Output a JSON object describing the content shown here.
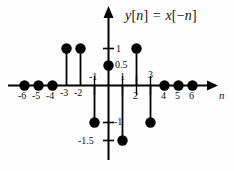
{
  "axis": {
    "x_label": "n",
    "y_label": ""
  },
  "tick_labels": {
    "x": [
      "-6",
      "-5",
      "-4",
      "-3",
      "-2",
      "-1",
      "1",
      "2",
      "3",
      "4",
      "5",
      "6"
    ],
    "y": [
      "1",
      "0.5",
      "-1",
      "-1.5"
    ]
  },
  "chart_data": {
    "type": "scatter",
    "xlabel": "n",
    "ylabel": "",
    "xlim": [
      -7,
      7
    ],
    "ylim": [
      -1.75,
      1.35
    ],
    "grid": false,
    "legend": null,
    "x": [
      -6,
      -5,
      -4,
      -3,
      -2,
      -1,
      0,
      1,
      2,
      3,
      4,
      5,
      6
    ],
    "values": [
      0,
      0,
      0,
      1,
      1,
      -1,
      0.5,
      -1.5,
      1,
      -1,
      0,
      0,
      0
    ],
    "xticks": [
      -6,
      -5,
      -4,
      -3,
      -2,
      -1,
      1,
      2,
      3,
      4,
      5,
      6
    ],
    "xticklabels": [
      "-6",
      "-5",
      "-4",
      "-3",
      "-2",
      "-1",
      "1",
      "2",
      "3",
      "4",
      "5",
      "6"
    ],
    "yticks": [
      1,
      0.5,
      -1,
      -1.5
    ],
    "yticklabels": [
      "1",
      "0.5",
      "-1",
      "-1.5"
    ],
    "marker": "filled-circle",
    "stem": true,
    "color": "#000000"
  }
}
